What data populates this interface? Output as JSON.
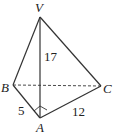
{
  "diagram": {
    "type": "tetrahedron",
    "vertices": {
      "V": {
        "label": "V",
        "x": 40,
        "y": 17
      },
      "B": {
        "label": "B",
        "x": 13,
        "y": 85
      },
      "C": {
        "label": "C",
        "x": 101,
        "y": 86
      },
      "A": {
        "label": "A",
        "x": 40,
        "y": 118
      }
    },
    "edges": [
      {
        "from": "V",
        "to": "B",
        "style": "solid"
      },
      {
        "from": "V",
        "to": "C",
        "style": "solid"
      },
      {
        "from": "V",
        "to": "A",
        "style": "solid"
      },
      {
        "from": "B",
        "to": "A",
        "style": "solid"
      },
      {
        "from": "A",
        "to": "C",
        "style": "solid"
      },
      {
        "from": "B",
        "to": "C",
        "style": "dashed"
      }
    ],
    "edge_labels": {
      "VA": "17",
      "BA": "5",
      "AC": "12"
    },
    "right_angle_at": "A"
  }
}
